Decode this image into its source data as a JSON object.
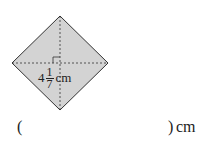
{
  "figure": {
    "shape": "square-rotated-45",
    "fill_color": "#d3d3d3",
    "stroke_color": "#333333",
    "diagonal_style": "dashed",
    "right_angle_mark": true,
    "label": {
      "whole": "4",
      "numerator": "1",
      "denominator": "7",
      "unit": "cm"
    }
  },
  "answer": {
    "open_paren": "(",
    "close_paren": ")",
    "unit": "cm",
    "value": ""
  }
}
